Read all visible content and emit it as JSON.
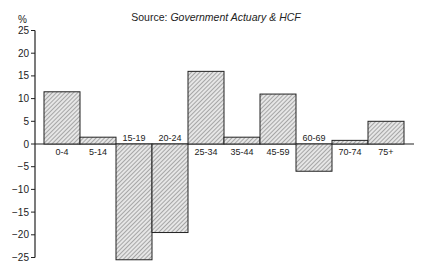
{
  "chart_data": {
    "type": "bar",
    "title": "",
    "subtitle_prefix": "Source: ",
    "subtitle_source": "Government Actuary & HCF",
    "ylabel": "%",
    "xlabel": "",
    "ylim": [
      -25,
      25
    ],
    "yticks": [
      25,
      20,
      15,
      10,
      5,
      0,
      -5,
      -10,
      -15,
      -20,
      -25
    ],
    "grid": false,
    "legend": null,
    "categories": [
      "0-4",
      "5-14",
      "15-19",
      "20-24",
      "25-34",
      "35-44",
      "45-59",
      "60-69",
      "70-74",
      "75+"
    ],
    "values": [
      11.5,
      1.5,
      -25.5,
      -19.5,
      16,
      1.5,
      11,
      -6,
      0.8,
      5
    ],
    "bar_fill": "hatched",
    "bar_color": "#bbbbbb",
    "edge_color": "#222222"
  }
}
